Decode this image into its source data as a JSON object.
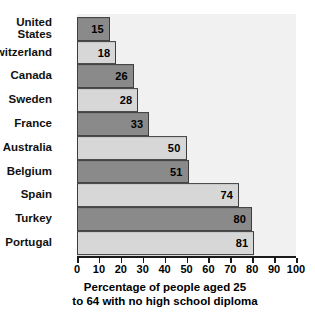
{
  "chart_data": {
    "type": "bar",
    "orientation": "horizontal",
    "title": "",
    "subtitle": "",
    "xlabel": "Percentage of people aged 25 to 64 with no high school diploma",
    "ylabel": "",
    "xlim": [
      0,
      100
    ],
    "grid": false,
    "legend": "none",
    "categories": [
      "United\nStates",
      "Switzerland",
      "Canada",
      "Sweden",
      "France",
      "Australia",
      "Belgium",
      "Spain",
      "Turkey",
      "Portugal"
    ],
    "values": [
      15,
      18,
      26,
      28,
      33,
      50,
      51,
      74,
      80,
      81
    ],
    "bar_colors": [
      "#8a8a8a",
      "#d7d7d7",
      "#8a8a8a",
      "#d7d7d7",
      "#8a8a8a",
      "#d7d7d7",
      "#8a8a8a",
      "#d7d7d7",
      "#8a8a8a",
      "#d7d7d7"
    ],
    "xticks": [
      0,
      10,
      20,
      30,
      40,
      50,
      60,
      70,
      80,
      90,
      100
    ],
    "xticklabels": [
      "0",
      "10",
      "20",
      "30",
      "40",
      "50",
      "60",
      "70",
      "80",
      "90",
      "100"
    ],
    "plot_background": "#f1f1f1",
    "page_background": "#ffffff",
    "bar_border_color": "#3d3d3d"
  },
  "caption": {
    "line1": "Percentage of people aged 25",
    "line2": "to 64 with no high school diploma"
  }
}
